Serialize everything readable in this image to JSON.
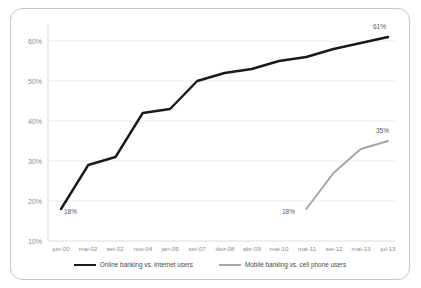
{
  "chart_data": {
    "type": "line",
    "title": "",
    "xlabel": "",
    "ylabel": "",
    "ylim": [
      10,
      65
    ],
    "yticks": [
      10,
      20,
      30,
      40,
      50,
      60
    ],
    "ytick_labels": [
      "10%",
      "20%",
      "30%",
      "40%",
      "50%",
      "60%"
    ],
    "grid": true,
    "legend_position": "bottom-center",
    "categories": [
      "jun-00",
      "mai-02",
      "set-02",
      "nov-04",
      "jan-05",
      "set-07",
      "dez-08",
      "abr-09",
      "mai-10",
      "mai-11",
      "set-12",
      "mai-13",
      "jul-13"
    ],
    "series": [
      {
        "name": "Online banking vs. internet users",
        "color": "#1a1a1a",
        "values": [
          18,
          29,
          31,
          42,
          43,
          50,
          52,
          53,
          55,
          56,
          58,
          59.5,
          61
        ]
      },
      {
        "name": "Mobile banking vs. cell phone users",
        "color": "#a6a6a6",
        "values": [
          null,
          null,
          null,
          null,
          null,
          null,
          null,
          null,
          null,
          18,
          27,
          33,
          35
        ]
      }
    ],
    "annotations": [
      {
        "text": "18%",
        "series": "Online banking vs. internet users",
        "category": "jun-00",
        "value": 18
      },
      {
        "text": "61%",
        "series": "Online banking vs. internet users",
        "category": "jul-13",
        "value": 61
      },
      {
        "text": "18%",
        "series": "Mobile banking vs. cell phone users",
        "category": "mai-11",
        "value": 18
      },
      {
        "text": "35%",
        "series": "Mobile banking vs. cell phone users",
        "category": "jul-13",
        "value": 35
      }
    ]
  },
  "legend": {
    "items": [
      {
        "label": "Online banking vs. internet users"
      },
      {
        "label": "Mobile banking vs. cell phone users"
      }
    ]
  },
  "yaxis": {
    "t0": "10%",
    "t1": "20%",
    "t2": "30%",
    "t3": "40%",
    "t4": "50%",
    "t5": "60%"
  },
  "xaxis": {
    "t0": "jun-00",
    "t1": "mai-02",
    "t2": "set-02",
    "t3": "nov-04",
    "t4": "jan-05",
    "t5": "set-07",
    "t6": "dez-08",
    "t7": "abr-09",
    "t8": "mai-10",
    "t9": "mai-11",
    "t10": "set-12",
    "t11": "mai-13",
    "t12": "jul-13"
  },
  "labels": {
    "a_start": "18%",
    "a_end": "61%",
    "b_start": "18%",
    "b_end": "35%"
  }
}
